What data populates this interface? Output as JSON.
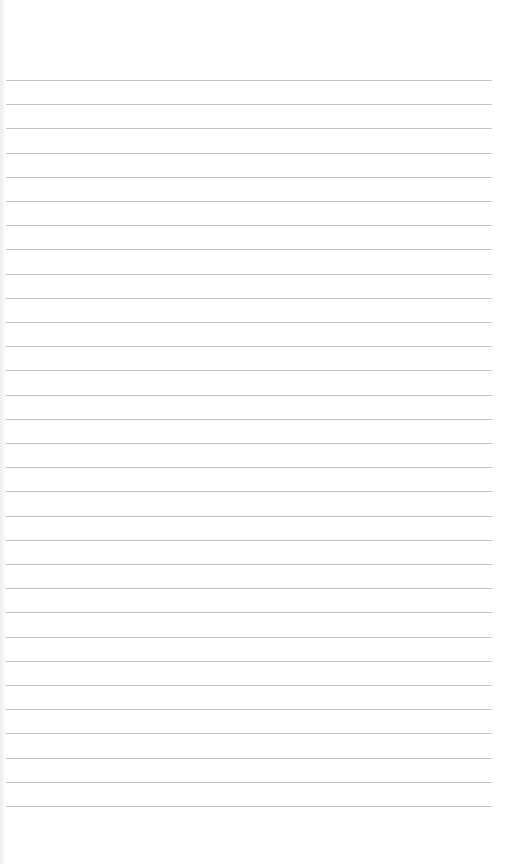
{
  "paper": {
    "background": "#ffffff",
    "line_color": "#c4c4c4",
    "line_count": 31,
    "first_line_y": 80,
    "line_spacing": 24.2,
    "line_left": 6,
    "line_right": 492
  }
}
